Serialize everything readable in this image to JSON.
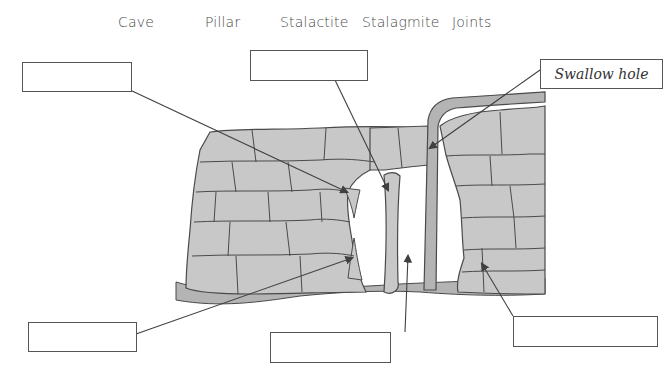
{
  "word_bank": [
    "Cave",
    "Pillar",
    "Stalactite",
    "Stalagmite",
    "Joints"
  ],
  "label_boxes": {
    "top_left": "",
    "top_center": "",
    "top_right": "Swallow hole",
    "bottom_left": "",
    "bottom_center": "",
    "bottom_right": ""
  },
  "colors": {
    "rock_fill": "#c8c8c8",
    "rock_outline": "#4a4a4a",
    "ground_fill": "#b4b4b4",
    "line": "#404040"
  }
}
